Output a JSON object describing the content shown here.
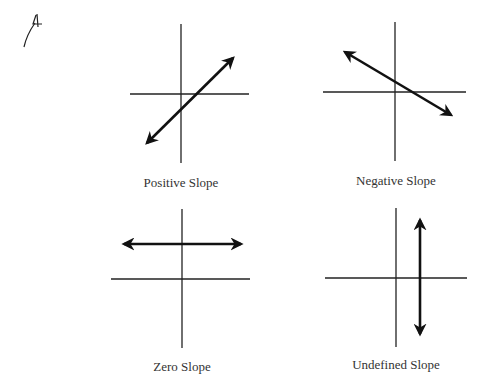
{
  "annotation": {
    "mark": "handwritten-4-with-arrow"
  },
  "panels": [
    {
      "id": "positive",
      "label": "Positive Slope",
      "axes": {
        "vx": 181,
        "vy1": 24,
        "vy2": 163,
        "hy": 94,
        "hx1": 130,
        "hx2": 249
      },
      "line": {
        "x1": 147,
        "y1": 143,
        "x2": 233,
        "y2": 58
      }
    },
    {
      "id": "negative",
      "label": "Negative Slope",
      "axes": {
        "vx": 395,
        "vy1": 22,
        "vy2": 161,
        "hy": 92,
        "hx1": 323,
        "hx2": 466
      },
      "line": {
        "x1": 345,
        "y1": 52,
        "x2": 451,
        "y2": 115
      }
    },
    {
      "id": "zero",
      "label": "Zero Slope",
      "axes": {
        "vx": 182,
        "vy1": 209,
        "vy2": 348,
        "hy": 279,
        "hx1": 111,
        "hx2": 250
      },
      "line": {
        "x1": 124,
        "y1": 244,
        "x2": 241,
        "y2": 244
      }
    },
    {
      "id": "undefined",
      "label": "Undefined Slope",
      "axes": {
        "vx": 396,
        "vy1": 208,
        "vy2": 347,
        "hy": 278,
        "hx1": 325,
        "hx2": 467
      },
      "line": {
        "x1": 420,
        "y1": 220,
        "x2": 420,
        "y2": 334
      }
    }
  ],
  "colors": {
    "axis": "#222222",
    "line": "#111111",
    "text": "#333333"
  }
}
